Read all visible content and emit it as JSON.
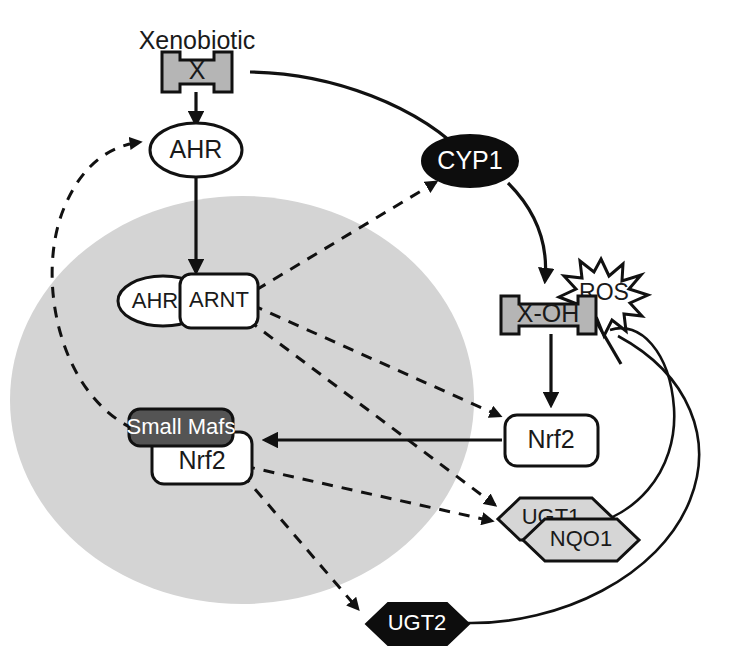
{
  "figure": {
    "background_color": "#ffffff",
    "nucleus": {
      "label": "nucleus",
      "fill_color": "#d4d4d4"
    }
  },
  "labels": {
    "xenobiotic": "Xenobiotic"
  },
  "nodes": {
    "x": {
      "label": "X",
      "shape": "tabbed-box",
      "fill": "#b5b5b5",
      "text_color": "#1a1a1a"
    },
    "ahr_cyto": {
      "label": "AHR",
      "shape": "ellipse",
      "fill": "#ffffff",
      "text_color": "#1a1a1a"
    },
    "ahr_nuc": {
      "label": "AHR",
      "shape": "ellipse",
      "fill": "#ffffff",
      "text_color": "#1a1a1a"
    },
    "arnt": {
      "label": "ARNT",
      "shape": "rounded-rect",
      "fill": "#ffffff",
      "text_color": "#1a1a1a"
    },
    "cyp1": {
      "label": "CYP1",
      "shape": "ellipse",
      "fill": "#0d0d0d",
      "text_color": "#ffffff"
    },
    "x_oh": {
      "label": "X-OH",
      "shape": "tabbed-box",
      "fill": "#b5b5b5",
      "text_color": "#1a1a1a"
    },
    "ros": {
      "label": "ROS",
      "shape": "starburst",
      "fill": "#ffffff",
      "text_color": "#1a1a1a"
    },
    "nrf2_cyto": {
      "label": "Nrf2",
      "shape": "rounded-rect",
      "fill": "#ffffff",
      "text_color": "#1a1a1a"
    },
    "small_mafs": {
      "label": "Small Mafs",
      "shape": "rounded-rect",
      "fill": "#545454",
      "text_color": "#ffffff"
    },
    "nrf2_nuc": {
      "label": "Nrf2",
      "shape": "rounded-rect",
      "fill": "#ffffff",
      "text_color": "#1a1a1a"
    },
    "ugt1": {
      "label": "UGT1",
      "shape": "hexagon",
      "fill": "#d6d6d6",
      "text_color": "#1a1a1a"
    },
    "nqo1": {
      "label": "NQO1",
      "shape": "hexagon",
      "fill": "#d6d6d6",
      "text_color": "#1a1a1a"
    },
    "ugt2": {
      "label": "UGT2",
      "shape": "hexagon",
      "fill": "#0d0d0d",
      "text_color": "#ffffff"
    }
  },
  "edges": [
    {
      "name": "x-to-ahr",
      "from": "x",
      "to": "ahr_cyto",
      "style": "solid-arrow"
    },
    {
      "name": "x-to-cyp1",
      "from": "x",
      "to": "cyp1",
      "style": "solid-curve"
    },
    {
      "name": "ahr-to-ahr-arnt",
      "from": "ahr_cyto",
      "to": "arnt",
      "style": "solid-arrow"
    },
    {
      "name": "arnt-to-cyp1",
      "from": "arnt",
      "to": "cyp1",
      "style": "dashed-arrow"
    },
    {
      "name": "arnt-to-nrf2-cyto",
      "from": "arnt",
      "to": "nrf2_cyto",
      "style": "dashed-arrow"
    },
    {
      "name": "arnt-to-ugt1",
      "from": "arnt",
      "to": "ugt1",
      "style": "dashed-arrow"
    },
    {
      "name": "cyp1-to-x-oh",
      "from": "cyp1",
      "to": "x_oh",
      "style": "solid-curve-arrow"
    },
    {
      "name": "x-oh-to-nrf2-cyto",
      "from": "x_oh",
      "to": "nrf2_cyto",
      "style": "solid-arrow"
    },
    {
      "name": "nrf2-cyto-to-small-mafs",
      "from": "nrf2_cyto",
      "to": "small_mafs",
      "style": "solid-arrow"
    },
    {
      "name": "nrf2-nuc-to-ugt1-nqo1",
      "from": "nrf2_nuc",
      "to": "nqo1",
      "style": "dashed-arrow"
    },
    {
      "name": "nrf2-nuc-to-ugt2",
      "from": "nrf2_nuc",
      "to": "ugt2",
      "style": "dashed-arrow"
    },
    {
      "name": "nrf2-nuc-to-ahr-feedback",
      "from": "nrf2_nuc",
      "to": "ahr_cyto",
      "style": "dashed-curve-arrow"
    },
    {
      "name": "nqo1-inhibits-ros",
      "from": "nqo1",
      "to": "ros",
      "style": "solid-curve-inhibition"
    },
    {
      "name": "ugt2-curve",
      "from": "ugt2",
      "to": "ros",
      "style": "solid-curve"
    }
  ]
}
